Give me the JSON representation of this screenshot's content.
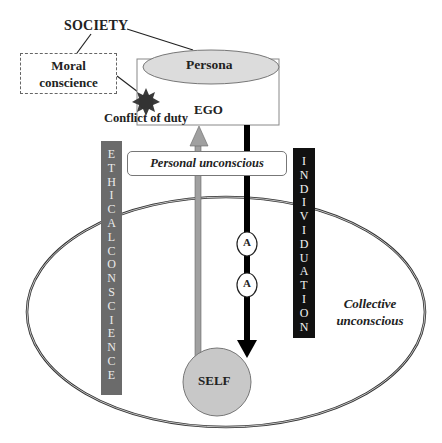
{
  "diagram": {
    "society_label": "SOCIETY",
    "moral_conscience": {
      "line1": "Moral",
      "line2": "conscience"
    },
    "ego": {
      "persona_label": "Persona",
      "ego_label": "EGO"
    },
    "conflict_label": "Conflict of duty",
    "personal_unconscious_label": "Personal unconscious",
    "ethical_conscience_letters": [
      "E",
      "T",
      "H",
      "I",
      "C",
      "A",
      "L",
      "C",
      "O",
      "N",
      "S",
      "C",
      "I",
      "E",
      "N",
      "C",
      "E"
    ],
    "ethical_conscience_label": "ETHICAL CONSCIENCE",
    "individuation_letters": [
      "I",
      "N",
      "D",
      "I",
      "V",
      "I",
      "D",
      "U",
      "A",
      "T",
      "I",
      "O",
      "N"
    ],
    "individuation_label": "INDIVIDUATION",
    "archetype_markers": [
      "A",
      "A"
    ],
    "collective_unconscious": {
      "line1": "Collective",
      "line2": "unconscious"
    },
    "self_label": "SELF",
    "colors": {
      "persona_fill": "#dcdcdc",
      "self_fill": "#c8c8c8",
      "ethical_bar": "#6b6b6b",
      "individuation_bar": "#111111",
      "upward_arrow": "#a0a0a0",
      "downward_arrow": "#000000",
      "starburst": "#3a3a3a"
    }
  }
}
